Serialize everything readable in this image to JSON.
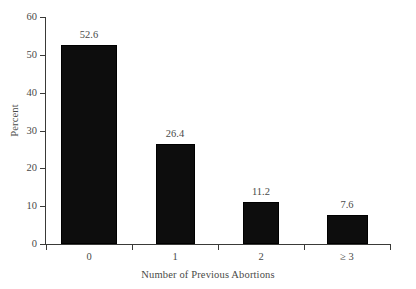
{
  "chart_data": {
    "type": "bar",
    "title": "",
    "xlabel": "Number of Previous Abortions",
    "ylabel": "Percent",
    "categories": [
      "0",
      "1",
      "2",
      "≥ 3"
    ],
    "values": [
      52.6,
      26.4,
      11.2,
      7.6
    ],
    "value_labels": [
      "52.6",
      "26.4",
      "11.2",
      "7.6"
    ],
    "ylim": [
      0,
      60
    ],
    "yticks": [
      0,
      10,
      20,
      30,
      40,
      50,
      60
    ],
    "ytick_labels": [
      "0",
      "10",
      "20",
      "30",
      "40",
      "50",
      "60"
    ],
    "grid": false,
    "legend": false,
    "bar_color": "#0d0d0d",
    "axis_color": "#3a3a38",
    "text_color": "#4a4a48",
    "background": "#ffffff"
  },
  "figure": {
    "x_axis_title": "Number of Previous Abortions",
    "y_axis_title": "Percent"
  }
}
